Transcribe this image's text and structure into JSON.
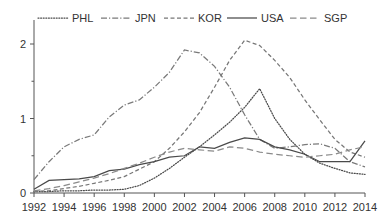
{
  "chart_data": {
    "type": "line",
    "title": "",
    "subtitle": "",
    "xlabel": "",
    "ylabel": "",
    "xlim": [
      1992,
      2014
    ],
    "ylim": [
      0,
      2.4
    ],
    "grid": false,
    "legend_position": "top",
    "x_tick_labels": [
      "1992",
      "1994",
      "1996",
      "1998",
      "2000",
      "2002",
      "2004",
      "2006",
      "2008",
      "2010",
      "2012",
      "2014"
    ],
    "x_ticks": [
      1992,
      1994,
      1996,
      1998,
      2000,
      2002,
      2004,
      2006,
      2008,
      2010,
      2012,
      2014
    ],
    "x_minor_ticks": [
      1993,
      1995,
      1997,
      1999,
      2001,
      2003,
      2005,
      2007,
      2009,
      2011,
      2013
    ],
    "y_tick_labels": [
      "0",
      "1",
      "2"
    ],
    "y_ticks": [
      0,
      1,
      2
    ],
    "y_minor_ticks": [
      0.5,
      1.5
    ],
    "x": [
      1992,
      1993,
      1994,
      1995,
      1996,
      1997,
      1998,
      1999,
      2000,
      2001,
      2002,
      2003,
      2004,
      2005,
      2006,
      2007,
      2008,
      2009,
      2010,
      2011,
      2012,
      2013,
      2014
    ],
    "series": [
      {
        "name": "PHL",
        "dash": "dotted",
        "color": "#4a4a4a",
        "values": [
          0.02,
          0.02,
          0.03,
          0.03,
          0.04,
          0.04,
          0.05,
          0.1,
          0.2,
          0.33,
          0.48,
          0.62,
          0.78,
          0.95,
          1.15,
          1.4,
          1.0,
          0.72,
          0.52,
          0.4,
          0.33,
          0.27,
          0.25
        ]
      },
      {
        "name": "JPN",
        "dash": "dash-dot",
        "color": "#7a7a7a",
        "values": [
          0.18,
          0.42,
          0.62,
          0.72,
          0.78,
          1.02,
          1.18,
          1.25,
          1.42,
          1.62,
          1.92,
          1.88,
          1.7,
          1.42,
          1.05,
          0.72,
          0.6,
          0.62,
          0.65,
          0.66,
          0.6,
          0.42,
          0.35
        ]
      },
      {
        "name": "KOR",
        "dash": "dashed",
        "color": "#777777",
        "values": [
          0.02,
          0.03,
          0.06,
          0.09,
          0.13,
          0.17,
          0.22,
          0.32,
          0.42,
          0.6,
          0.82,
          1.08,
          1.42,
          1.78,
          2.05,
          1.98,
          1.78,
          1.55,
          1.25,
          0.98,
          0.72,
          0.55,
          0.48
        ]
      },
      {
        "name": "USA",
        "dash": "solid",
        "color": "#4a4a4a",
        "values": [
          0.05,
          0.17,
          0.18,
          0.19,
          0.22,
          0.3,
          0.32,
          0.38,
          0.42,
          0.48,
          0.5,
          0.62,
          0.6,
          0.68,
          0.74,
          0.72,
          0.62,
          0.58,
          0.52,
          0.42,
          0.42,
          0.42,
          0.7
        ]
      },
      {
        "name": "SGP",
        "dash": "long-dash",
        "color": "#8a8a8a",
        "values": [
          0.03,
          0.06,
          0.1,
          0.15,
          0.2,
          0.26,
          0.33,
          0.4,
          0.48,
          0.55,
          0.6,
          0.58,
          0.56,
          0.62,
          0.6,
          0.55,
          0.52,
          0.5,
          0.48,
          0.5,
          0.52,
          0.58,
          0.62
        ]
      }
    ],
    "legend": [
      {
        "label": "PHL",
        "dash": "dotted",
        "color": "#4a4a4a"
      },
      {
        "label": "JPN",
        "dash": "dash-dot",
        "color": "#7a7a7a"
      },
      {
        "label": "KOR",
        "dash": "dashed",
        "color": "#777777"
      },
      {
        "label": "USA",
        "dash": "solid",
        "color": "#4a4a4a"
      },
      {
        "label": "SGP",
        "dash": "long-dash",
        "color": "#8a8a8a"
      }
    ]
  },
  "axis": {
    "axis_color": "#555555"
  }
}
